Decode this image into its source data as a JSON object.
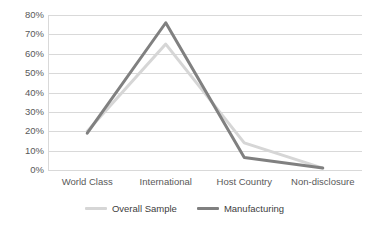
{
  "chart_data": {
    "type": "line",
    "title": "",
    "subtitle": "",
    "xlabel": "",
    "ylabel": "",
    "categories": [
      "World Class",
      "International",
      "Host Country",
      "Non-disclosure"
    ],
    "series": [
      {
        "name": "Overall Sample",
        "color": "#d6d6d6",
        "values": [
          20,
          65,
          14,
          1
        ]
      },
      {
        "name": "Manufacturing",
        "color": "#808080",
        "values": [
          19,
          76,
          6.5,
          1
        ]
      }
    ],
    "ylim": [
      0,
      80
    ],
    "yticks": [
      0,
      10,
      20,
      30,
      40,
      50,
      60,
      70,
      80
    ],
    "ytick_labels": [
      "0%",
      "10%",
      "20%",
      "30%",
      "40%",
      "50%",
      "60%",
      "70%",
      "80%"
    ],
    "value_suffix": "%",
    "grid": true,
    "grid_axis": "y",
    "grid_color": "#d9d9d9",
    "legend_position": "bottom",
    "background": "#ffffff",
    "axis_text_color": "#595959"
  }
}
